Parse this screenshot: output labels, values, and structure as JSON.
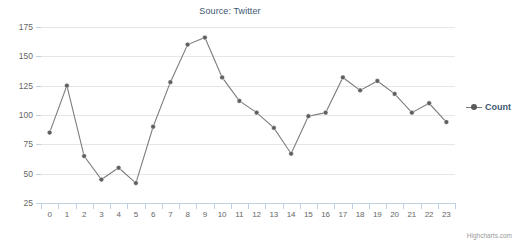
{
  "chart": {
    "title": "Source: Twitter",
    "credits": "Highcharts.com"
  },
  "legend": {
    "items": [
      {
        "label": "Count",
        "color": "#7c7c7c",
        "symbol": "line-marker-icon"
      }
    ]
  },
  "chart_data": {
    "type": "line",
    "title": "Source: Twitter",
    "xlabel": "",
    "ylabel": "Count",
    "categories": [
      "0",
      "1",
      "2",
      "3",
      "4",
      "5",
      "6",
      "7",
      "8",
      "9",
      "10",
      "11",
      "12",
      "13",
      "14",
      "15",
      "16",
      "17",
      "18",
      "19",
      "20",
      "21",
      "22",
      "23"
    ],
    "ylim": [
      25,
      175
    ],
    "yticks": [
      25,
      50,
      75,
      100,
      125,
      150,
      175
    ],
    "grid": true,
    "legend_position": "right",
    "series": [
      {
        "name": "Count",
        "color": "#7c7c7c",
        "marker": "circle",
        "values": [
          85,
          125,
          65,
          45,
          55,
          42,
          90,
          128,
          160,
          166,
          132,
          112,
          102,
          89,
          67,
          99,
          102,
          132,
          121,
          129,
          118,
          102,
          110,
          94
        ]
      }
    ]
  }
}
